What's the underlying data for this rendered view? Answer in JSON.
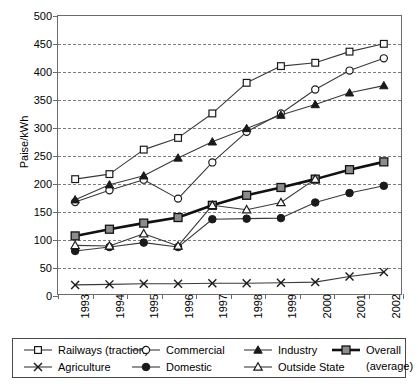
{
  "chart_data": {
    "type": "line",
    "title": "",
    "xlabel": "",
    "ylabel": "Paise/kWh",
    "x": [
      1993,
      1994,
      1995,
      1996,
      1997,
      1998,
      1999,
      2000,
      2001,
      2002
    ],
    "categories": [
      "1993",
      "1994",
      "1995",
      "1996",
      "1997",
      "1998",
      "1999",
      "2000",
      "2001",
      "2002"
    ],
    "ylim": [
      0,
      500
    ],
    "ytick_values": [
      0,
      50,
      100,
      150,
      200,
      250,
      300,
      350,
      400,
      450,
      500
    ],
    "ytick_labels": [
      "0",
      "50",
      "100",
      "150",
      "200",
      "250",
      "300",
      "350",
      "400",
      "450",
      "500"
    ],
    "grid": "horizontal-dashed",
    "legend_position": "bottom",
    "series": [
      {
        "name": "Railways (traction)",
        "marker": "open-square",
        "values": [
          207,
          216,
          260,
          281,
          325,
          380,
          410,
          416,
          436,
          450
        ]
      },
      {
        "name": "Commercial",
        "marker": "open-circle",
        "values": [
          166,
          187,
          206,
          172,
          237,
          292,
          325,
          368,
          402,
          424
        ]
      },
      {
        "name": "Industry",
        "marker": "filled-triangle",
        "values": [
          170,
          197,
          213,
          245,
          274,
          298,
          322,
          341,
          362,
          375
        ]
      },
      {
        "name": "Overall (average)",
        "marker": "filled-square",
        "values": [
          105,
          117,
          128,
          138,
          160,
          178,
          192,
          207,
          224,
          238
        ]
      },
      {
        "name": "Agriculture",
        "marker": "cross-x",
        "values": [
          17,
          18,
          19,
          19,
          20,
          20,
          21,
          22,
          32,
          40
        ]
      },
      {
        "name": "Domestic",
        "marker": "filled-circle",
        "values": [
          78,
          85,
          93,
          85,
          135,
          136,
          137,
          165,
          182,
          195
        ]
      },
      {
        "name": "Outside State",
        "marker": "open-triangle",
        "values": [
          88,
          87,
          109,
          87,
          160,
          152,
          165,
          207,
          null,
          null
        ]
      }
    ]
  },
  "legend": {
    "entries": [
      {
        "label": "Railways (traction)",
        "icon": "open-square-marker-icon"
      },
      {
        "label": "Commercial",
        "icon": "open-circle-marker-icon"
      },
      {
        "label": "Industry",
        "icon": "filled-triangle-marker-icon"
      },
      {
        "label": "Overall",
        "icon": "filled-square-marker-icon"
      },
      {
        "label": "Agriculture",
        "icon": "cross-x-marker-icon"
      },
      {
        "label": "Domestic",
        "icon": "filled-circle-marker-icon"
      },
      {
        "label": "Outside State",
        "icon": "open-triangle-marker-icon"
      }
    ],
    "overall_second_line": "(average)"
  },
  "colors": {
    "axis": "#6b6b6b",
    "grid": "#7d7d7d",
    "line": "#3a3a3a",
    "overall_line": "#111111",
    "overall_marker_fill": "#8c8c8c",
    "marker_fill_dark": "#1a1a1a",
    "marker_fill_open": "#ffffff",
    "background": "#ffffff"
  }
}
